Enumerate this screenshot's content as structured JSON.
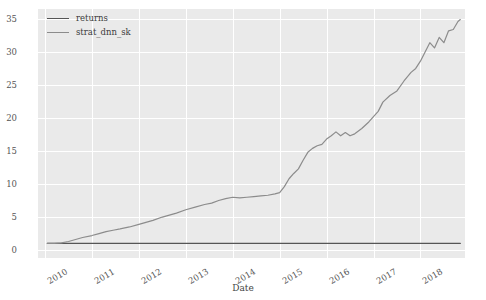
{
  "chart_data": {
    "type": "line",
    "title": "",
    "xlabel": "Date",
    "ylabel": "",
    "grid": true,
    "legend_position": "upper left",
    "ylim": [
      -1.2,
      36.5
    ],
    "yticks": [
      0,
      5,
      10,
      15,
      20,
      25,
      30,
      35
    ],
    "ytick_labels": [
      "0",
      "5",
      "10",
      "15",
      "20",
      "25",
      "30",
      "35"
    ],
    "xlim": [
      2009.85,
      2018.95
    ],
    "xticks": [
      2010,
      2011,
      2012,
      2013,
      2014,
      2015,
      2016,
      2017,
      2018
    ],
    "xtick_labels": [
      "2010",
      "2011",
      "2012",
      "2013",
      "2014",
      "2015",
      "2016",
      "2017",
      "2018"
    ],
    "xtick_rotation": -30,
    "colors": {
      "returns": "#555555",
      "strat_dnn_sk": "#8c8c8c",
      "plot_background": "#eaeaea",
      "gridline": "#ffffff",
      "figure_background": "#ffffff",
      "tick_label": "#555555"
    },
    "series": [
      {
        "name": "returns",
        "color": "#555555",
        "x": [
          2010.05,
          2010.5,
          2011.0,
          2011.5,
          2012.0,
          2012.5,
          2013.0,
          2013.5,
          2014.0,
          2014.5,
          2015.0,
          2015.5,
          2016.0,
          2016.5,
          2017.0,
          2017.5,
          2018.0,
          2018.5,
          2018.85
        ],
        "values": [
          1.0,
          1.0,
          1.0,
          1.0,
          1.0,
          1.0,
          1.0,
          1.0,
          1.0,
          1.0,
          1.0,
          1.0,
          1.0,
          1.0,
          1.0,
          1.0,
          1.0,
          1.0,
          1.0
        ]
      },
      {
        "name": "strat_dnn_sk",
        "color": "#8c8c8c",
        "x": [
          2010.05,
          2010.2,
          2010.35,
          2010.5,
          2010.65,
          2010.8,
          2011.0,
          2011.15,
          2011.3,
          2011.45,
          2011.6,
          2011.8,
          2012.0,
          2012.15,
          2012.3,
          2012.5,
          2012.65,
          2012.8,
          2013.0,
          2013.2,
          2013.4,
          2013.55,
          2013.7,
          2013.85,
          2014.0,
          2014.15,
          2014.3,
          2014.45,
          2014.6,
          2014.75,
          2014.9,
          2015.0,
          2015.1,
          2015.2,
          2015.3,
          2015.4,
          2015.5,
          2015.6,
          2015.7,
          2015.8,
          2015.9,
          2016.0,
          2016.1,
          2016.2,
          2016.3,
          2016.4,
          2016.5,
          2016.6,
          2016.75,
          2016.9,
          2017.0,
          2017.1,
          2017.2,
          2017.35,
          2017.5,
          2017.65,
          2017.8,
          2017.9,
          2018.0,
          2018.1,
          2018.2,
          2018.3,
          2018.4,
          2018.5,
          2018.6,
          2018.7,
          2018.8,
          2018.85
        ],
        "values": [
          1.0,
          1.0,
          1.1,
          1.3,
          1.6,
          1.9,
          2.2,
          2.5,
          2.8,
          3.0,
          3.2,
          3.5,
          3.9,
          4.2,
          4.5,
          5.0,
          5.3,
          5.6,
          6.1,
          6.5,
          6.9,
          7.1,
          7.5,
          7.8,
          8.0,
          7.9,
          8.0,
          8.1,
          8.2,
          8.3,
          8.5,
          8.7,
          9.6,
          10.8,
          11.6,
          12.3,
          13.6,
          14.8,
          15.4,
          15.8,
          16.0,
          16.8,
          17.3,
          17.9,
          17.3,
          17.8,
          17.3,
          17.6,
          18.4,
          19.4,
          20.2,
          21.0,
          22.4,
          23.4,
          24.1,
          25.6,
          26.9,
          27.5,
          28.6,
          30.0,
          31.4,
          30.6,
          32.2,
          31.4,
          33.2,
          33.4,
          34.6,
          34.9
        ]
      }
    ]
  },
  "legend": {
    "items": [
      {
        "label": "returns",
        "color": "#555555"
      },
      {
        "label": "strat_dnn_sk",
        "color": "#8c8c8c"
      }
    ]
  },
  "axes": {
    "xlabel": "Date"
  }
}
